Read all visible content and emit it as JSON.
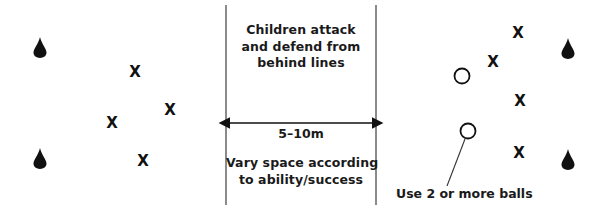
{
  "diagram": {
    "width": 605,
    "height": 214,
    "background_color": "#ffffff",
    "ink_color": "#1a1a1a",
    "line_color": "#6e6e6e"
  },
  "annotations": {
    "top_center": "Children attack\nand defend from\nbehind lines",
    "dimension_label": "5–10m",
    "bottom_center": "Vary space according\nto ability/success",
    "balls_caption": "Use 2 or more balls"
  },
  "zones": {
    "left_zone_label": "left-team-zone",
    "middle_zone_label": "neutral-channel",
    "right_zone_label": "right-team-zone"
  },
  "markers": {
    "left_players": [
      {
        "label": "X",
        "x": 135,
        "y": 72
      },
      {
        "label": "X",
        "x": 170,
        "y": 110
      },
      {
        "label": "X",
        "x": 112,
        "y": 123
      },
      {
        "label": "X",
        "x": 143,
        "y": 161
      }
    ],
    "right_players": [
      {
        "label": "X",
        "x": 518,
        "y": 33
      },
      {
        "label": "X",
        "x": 493,
        "y": 62
      },
      {
        "label": "X",
        "x": 520,
        "y": 101
      },
      {
        "label": "X",
        "x": 519,
        "y": 153
      }
    ],
    "left_cones": [
      {
        "x": 40,
        "y": 47
      },
      {
        "x": 40,
        "y": 158
      }
    ],
    "right_cones": [
      {
        "x": 568,
        "y": 48
      },
      {
        "x": 568,
        "y": 159
      }
    ],
    "balls": [
      {
        "x": 462,
        "y": 76,
        "r": 7.5
      },
      {
        "x": 468,
        "y": 131,
        "r": 7.5
      }
    ]
  },
  "lines": {
    "left_boundary": {
      "x": 226,
      "y1": 5,
      "y2": 205
    },
    "right_boundary": {
      "x": 376,
      "y1": 5,
      "y2": 205
    },
    "dimension_arrow": {
      "x1": 228,
      "x2": 374,
      "y": 123
    },
    "ball_leader": {
      "x1": 466,
      "y1": 139,
      "x2": 447,
      "y2": 185
    }
  }
}
